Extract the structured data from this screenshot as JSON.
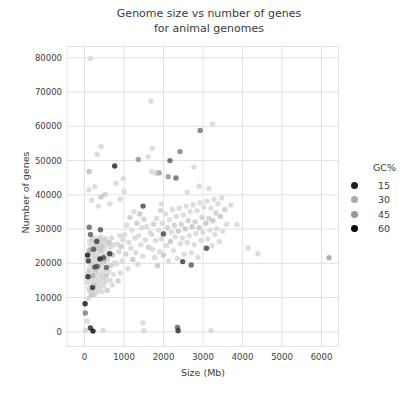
{
  "chart_data": {
    "type": "scatter",
    "title_lines": [
      "Genome size vs number of genes",
      "for animal genomes"
    ],
    "xlabel": "Size (Mb)",
    "ylabel": "Number of genes",
    "xlim": [
      -443,
      6430
    ],
    "ylim": [
      -4290,
      83300
    ],
    "xticks": [
      0,
      1000,
      2000,
      3000,
      4000,
      5000,
      6000
    ],
    "yticks": [
      0,
      10000,
      20000,
      30000,
      40000,
      50000,
      60000,
      70000,
      80000
    ],
    "grid": true,
    "grid_color": "#e2e2e2",
    "tick_label_color": "#3d3d3d",
    "point_opacity": 0.85,
    "legend": {
      "title": "GC%",
      "entries": [
        15,
        30,
        45,
        60
      ],
      "position": "right"
    },
    "gc_shade_ramp": [
      [
        15,
        30
      ],
      [
        22,
        100
      ],
      [
        30,
        170
      ],
      [
        35,
        215
      ],
      [
        40,
        215
      ],
      [
        45,
        150
      ],
      [
        50,
        95
      ],
      [
        55,
        50
      ],
      [
        60,
        12
      ]
    ],
    "points": [
      [
        60,
        21600,
        36
      ],
      [
        70,
        14300,
        35
      ],
      [
        78,
        22400,
        58
      ],
      [
        88,
        9700,
        36
      ],
      [
        92,
        17300,
        34
      ],
      [
        98,
        21400,
        37
      ],
      [
        105,
        12600,
        35
      ],
      [
        112,
        23600,
        33
      ],
      [
        118,
        18300,
        36
      ],
      [
        124,
        15700,
        38
      ],
      [
        130,
        26400,
        35
      ],
      [
        136,
        11900,
        34
      ],
      [
        142,
        20300,
        36
      ],
      [
        148,
        23900,
        31
      ],
      [
        152,
        13400,
        37
      ],
      [
        158,
        17900,
        35
      ],
      [
        163,
        25100,
        36
      ],
      [
        168,
        10600,
        33
      ],
      [
        172,
        19400,
        38
      ],
      [
        178,
        22700,
        35
      ],
      [
        183,
        14900,
        36
      ],
      [
        188,
        26900,
        34
      ],
      [
        192,
        12300,
        37
      ],
      [
        198,
        21100,
        35
      ],
      [
        204,
        16400,
        30
      ],
      [
        210,
        24400,
        36
      ],
      [
        216,
        11300,
        34
      ],
      [
        222,
        18700,
        36
      ],
      [
        228,
        27400,
        35
      ],
      [
        234,
        13700,
        33
      ],
      [
        240,
        22100,
        37
      ],
      [
        246,
        15400,
        35
      ],
      [
        252,
        25700,
        36
      ],
      [
        258,
        10900,
        38
      ],
      [
        264,
        20100,
        34
      ],
      [
        270,
        23100,
        36
      ],
      [
        276,
        12700,
        35
      ],
      [
        282,
        17600,
        33
      ],
      [
        288,
        26100,
        37
      ],
      [
        294,
        14100,
        35
      ],
      [
        300,
        21700,
        36
      ],
      [
        306,
        24700,
        34
      ],
      [
        312,
        11600,
        36
      ],
      [
        318,
        19100,
        52
      ],
      [
        324,
        22400,
        35
      ],
      [
        330,
        16100,
        37
      ],
      [
        336,
        25400,
        34
      ],
      [
        342,
        13100,
        36
      ],
      [
        348,
        20700,
        35
      ],
      [
        354,
        27100,
        33
      ],
      [
        360,
        15100,
        37
      ],
      [
        366,
        23400,
        35
      ],
      [
        372,
        18400,
        36
      ],
      [
        378,
        26400,
        34
      ],
      [
        384,
        12400,
        35
      ],
      [
        390,
        21300,
        57
      ],
      [
        396,
        16700,
        36
      ],
      [
        402,
        24100,
        33
      ],
      [
        410,
        14400,
        35
      ],
      [
        418,
        27700,
        37
      ],
      [
        426,
        19700,
        34
      ],
      [
        434,
        23700,
        36
      ],
      [
        442,
        11700,
        35
      ],
      [
        450,
        25100,
        33
      ],
      [
        458,
        17100,
        36
      ],
      [
        466,
        22700,
        37
      ],
      [
        474,
        15700,
        34
      ],
      [
        482,
        26700,
        35
      ],
      [
        490,
        13400,
        36
      ],
      [
        498,
        20400,
        33
      ],
      [
        508,
        24400,
        35
      ],
      [
        518,
        18100,
        37
      ],
      [
        528,
        27100,
        34
      ],
      [
        538,
        14700,
        36
      ],
      [
        548,
        22100,
        35
      ],
      [
        558,
        16400,
        33
      ],
      [
        568,
        25700,
        36
      ],
      [
        578,
        12100,
        34
      ],
      [
        588,
        21100,
        37
      ],
      [
        598,
        23100,
        35
      ],
      [
        610,
        17700,
        36
      ],
      [
        625,
        26100,
        33
      ],
      [
        640,
        15100,
        35
      ],
      [
        655,
        24700,
        37
      ],
      [
        670,
        19400,
        34
      ],
      [
        685,
        27400,
        36
      ],
      [
        700,
        13700,
        35
      ],
      [
        715,
        22400,
        33
      ],
      [
        730,
        16700,
        36
      ],
      [
        745,
        25400,
        35
      ],
      [
        760,
        20100,
        37
      ],
      [
        810,
        19800,
        35
      ],
      [
        830,
        25600,
        36
      ],
      [
        850,
        14900,
        34
      ],
      [
        870,
        23400,
        36
      ],
      [
        890,
        28100,
        35
      ],
      [
        910,
        17200,
        37
      ],
      [
        930,
        24900,
        33
      ],
      [
        950,
        20600,
        36
      ],
      [
        970,
        26900,
        35
      ],
      [
        95,
        20700,
        54
      ],
      [
        150,
        28400,
        50
      ],
      [
        205,
        12900,
        55
      ],
      [
        260,
        18900,
        20
      ],
      [
        310,
        26400,
        53
      ],
      [
        85,
        16100,
        56
      ],
      [
        230,
        24100,
        51
      ],
      [
        480,
        21600,
        52
      ],
      [
        555,
        18800,
        50
      ],
      [
        640,
        22800,
        55
      ],
      [
        120,
        30500,
        49
      ],
      [
        405,
        29800,
        51
      ],
      [
        110,
        41500,
        36
      ],
      [
        180,
        38400,
        36
      ],
      [
        260,
        42400,
        36
      ],
      [
        350,
        36700,
        35
      ],
      [
        420,
        39400,
        33
      ],
      [
        520,
        40100,
        34
      ],
      [
        640,
        37400,
        37
      ],
      [
        800,
        43400,
        35
      ],
      [
        900,
        38700,
        36
      ],
      [
        980,
        44800,
        35
      ],
      [
        765,
        48400,
        56
      ],
      [
        320,
        51800,
        36
      ],
      [
        420,
        54100,
        36
      ],
      [
        120,
        46800,
        42
      ],
      [
        150,
        79800,
        36
      ],
      [
        30,
        300,
        36
      ],
      [
        215,
        200,
        59
      ],
      [
        470,
        400,
        38
      ],
      [
        20,
        5500,
        47
      ],
      [
        15,
        8200,
        58
      ],
      [
        70,
        3100,
        35
      ],
      [
        150,
        1100,
        17
      ],
      [
        1005,
        41000,
        36
      ],
      [
        1015,
        28400,
        35
      ],
      [
        1045,
        22700,
        34
      ],
      [
        1075,
        31100,
        36
      ],
      [
        1100,
        18400,
        35
      ],
      [
        1120,
        26100,
        37
      ],
      [
        1150,
        33400,
        34
      ],
      [
        1175,
        24400,
        36
      ],
      [
        1200,
        29700,
        35
      ],
      [
        1225,
        21100,
        33
      ],
      [
        1250,
        35100,
        36
      ],
      [
        1275,
        27400,
        35
      ],
      [
        1300,
        23100,
        37
      ],
      [
        1325,
        31700,
        34
      ],
      [
        1350,
        19700,
        36
      ],
      [
        1375,
        28100,
        35
      ],
      [
        1400,
        34400,
        33
      ],
      [
        1425,
        25400,
        36
      ],
      [
        1450,
        30400,
        35
      ],
      [
        1475,
        22100,
        37
      ],
      [
        1500,
        32900,
        34
      ],
      [
        1540,
        26900,
        36
      ],
      [
        1580,
        30700,
        35
      ],
      [
        1620,
        24700,
        34
      ],
      [
        1660,
        28900,
        36
      ],
      [
        1484,
        36700,
        52
      ],
      [
        1362,
        50300,
        45
      ],
      [
        1615,
        51100,
        37
      ],
      [
        1680,
        67300,
        35
      ],
      [
        1716,
        53500,
        38
      ],
      [
        1480,
        2600,
        40
      ],
      [
        1505,
        300,
        36
      ],
      [
        1700,
        28400,
        36
      ],
      [
        1725,
        24100,
        35
      ],
      [
        1750,
        31400,
        34
      ],
      [
        1775,
        21700,
        37
      ],
      [
        1800,
        26700,
        35
      ],
      [
        1825,
        33100,
        36
      ],
      [
        1850,
        19400,
        33
      ],
      [
        1875,
        29700,
        35
      ],
      [
        1900,
        23400,
        37
      ],
      [
        1925,
        35400,
        34
      ],
      [
        1950,
        27100,
        36
      ],
      [
        1975,
        31700,
        35
      ],
      [
        2000,
        22400,
        33
      ],
      [
        2025,
        28700,
        37
      ],
      [
        2050,
        34400,
        35
      ],
      [
        2075,
        25100,
        36
      ],
      [
        2100,
        30400,
        34
      ],
      [
        2125,
        20700,
        36
      ],
      [
        2150,
        32700,
        35
      ],
      [
        2175,
        26400,
        33
      ],
      [
        2200,
        29100,
        37
      ],
      [
        2225,
        35700,
        35
      ],
      [
        2250,
        23700,
        36
      ],
      [
        2275,
        31100,
        34
      ],
      [
        2300,
        27700,
        36
      ],
      [
        2325,
        33700,
        35
      ],
      [
        2350,
        21400,
        37
      ],
      [
        2375,
        29400,
        33
      ],
      [
        2400,
        36100,
        35
      ],
      [
        2425,
        25700,
        36
      ],
      [
        2450,
        31400,
        34
      ],
      [
        2475,
        27400,
        36
      ],
      [
        2500,
        34100,
        35
      ],
      [
        2525,
        22700,
        37
      ],
      [
        2550,
        30100,
        33
      ],
      [
        2575,
        36700,
        35
      ],
      [
        2600,
        26100,
        36
      ],
      [
        2625,
        32400,
        34
      ],
      [
        2650,
        28100,
        36
      ],
      [
        2675,
        35100,
        35
      ],
      [
        2700,
        23100,
        37
      ],
      [
        2725,
        30700,
        33
      ],
      [
        2750,
        37100,
        35
      ],
      [
        2775,
        25400,
        36
      ],
      [
        2800,
        32100,
        34
      ],
      [
        2825,
        28700,
        36
      ],
      [
        2850,
        35400,
        35
      ],
      [
        2875,
        21700,
        37
      ],
      [
        2900,
        30400,
        33
      ],
      [
        2925,
        37700,
        35
      ],
      [
        2950,
        26700,
        36
      ],
      [
        2975,
        33400,
        34
      ],
      [
        3000,
        29100,
        36
      ],
      [
        3025,
        36400,
        35
      ],
      [
        3050,
        24400,
        37
      ],
      [
        3075,
        31700,
        33
      ],
      [
        3100,
        38100,
        35
      ],
      [
        3125,
        27100,
        36
      ],
      [
        3150,
        33100,
        34
      ],
      [
        3175,
        29700,
        36
      ],
      [
        3200,
        36100,
        35
      ],
      [
        3225,
        25100,
        37
      ],
      [
        3250,
        32400,
        33
      ],
      [
        3275,
        38700,
        35
      ],
      [
        3300,
        28400,
        36
      ],
      [
        3325,
        34700,
        34
      ],
      [
        3350,
        30100,
        36
      ],
      [
        3380,
        37400,
        35
      ],
      [
        3410,
        26400,
        37
      ],
      [
        3440,
        33700,
        33
      ],
      [
        3470,
        39100,
        35
      ],
      [
        3500,
        29400,
        36
      ],
      [
        3550,
        35700,
        34
      ],
      [
        3600,
        31400,
        36
      ],
      [
        1995,
        28600,
        52
      ],
      [
        2165,
        50000,
        50
      ],
      [
        2316,
        44900,
        49
      ],
      [
        2418,
        52600,
        47
      ],
      [
        2485,
        20500,
        53
      ],
      [
        2700,
        19500,
        50
      ],
      [
        2930,
        58800,
        48
      ],
      [
        3090,
        24400,
        52
      ],
      [
        2370,
        300,
        55
      ],
      [
        2355,
        1300,
        50
      ],
      [
        3245,
        60700,
        36
      ],
      [
        3200,
        300,
        36
      ],
      [
        1894,
        46400,
        44
      ],
      [
        1810,
        46200,
        36
      ],
      [
        1835,
        46600,
        36
      ],
      [
        2120,
        45300,
        45
      ],
      [
        2772,
        48100,
        36
      ],
      [
        1700,
        46800,
        36
      ],
      [
        1949,
        37300,
        36
      ],
      [
        2600,
        40800,
        36
      ],
      [
        2900,
        42500,
        36
      ],
      [
        3150,
        41800,
        36
      ],
      [
        3700,
        37000,
        36
      ],
      [
        3860,
        31300,
        35
      ],
      [
        4140,
        24500,
        36
      ],
      [
        4390,
        22800,
        35
      ],
      [
        6190,
        21600,
        44
      ]
    ]
  }
}
